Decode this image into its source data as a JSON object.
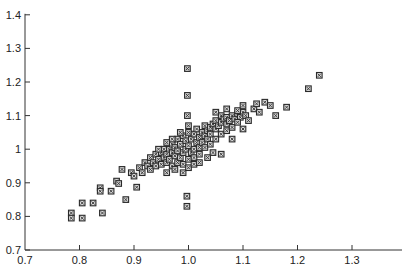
{
  "chart_data": {
    "type": "scatter",
    "title": "",
    "xlabel": "",
    "ylabel": "",
    "xlim": [
      0.7,
      1.385
    ],
    "ylim": [
      0.7,
      1.4
    ],
    "xticks": [
      0.7,
      0.8,
      0.9,
      1.0,
      1.1,
      1.2,
      1.3
    ],
    "xtick_labels": [
      "0.7",
      "0.8",
      "0.9",
      "1.0",
      "1.1",
      "1.2",
      "1.3"
    ],
    "yticks": [
      0.7,
      0.8,
      0.9,
      1.0,
      1.1,
      1.2,
      1.3,
      1.4
    ],
    "ytick_labels": [
      "0.7",
      "0.8",
      "0.9",
      "1",
      "1.1",
      "1.2",
      "1.3",
      "1.4"
    ],
    "grid": false,
    "legend": null,
    "marker": "square-with-dot",
    "marker_color": "#333333",
    "series": [
      {
        "name": "points",
        "points": [
          [
            0.785,
            0.81
          ],
          [
            0.785,
            0.795
          ],
          [
            0.805,
            0.795
          ],
          [
            0.805,
            0.84
          ],
          [
            0.825,
            0.84
          ],
          [
            0.838,
            0.885
          ],
          [
            0.838,
            0.875
          ],
          [
            0.842,
            0.81
          ],
          [
            0.858,
            0.875
          ],
          [
            0.868,
            0.905
          ],
          [
            0.872,
            0.898
          ],
          [
            0.878,
            0.94
          ],
          [
            0.895,
            0.93
          ],
          [
            0.905,
            0.887
          ],
          [
            0.885,
            0.85
          ],
          [
            0.9,
            0.92
          ],
          [
            0.91,
            0.945
          ],
          [
            0.915,
            0.93
          ],
          [
            0.92,
            0.96
          ],
          [
            0.925,
            0.95
          ],
          [
            0.93,
            0.94
          ],
          [
            0.93,
            0.975
          ],
          [
            0.935,
            0.96
          ],
          [
            0.94,
            0.95
          ],
          [
            0.94,
            0.985
          ],
          [
            0.945,
            0.97
          ],
          [
            0.95,
            0.955
          ],
          [
            0.95,
            0.99
          ],
          [
            0.955,
            0.975
          ],
          [
            0.955,
            1.0
          ],
          [
            0.96,
            0.96
          ],
          [
            0.96,
            0.985
          ],
          [
            0.965,
            1.0
          ],
          [
            0.965,
            0.97
          ],
          [
            0.97,
            0.95
          ],
          [
            0.97,
            0.99
          ],
          [
            0.97,
            1.015
          ],
          [
            0.975,
            0.98
          ],
          [
            0.975,
            1.005
          ],
          [
            0.98,
            0.96
          ],
          [
            0.98,
            0.995
          ],
          [
            0.98,
            1.03
          ],
          [
            0.985,
            0.975
          ],
          [
            0.985,
            1.015
          ],
          [
            0.99,
            0.99
          ],
          [
            0.99,
            1.04
          ],
          [
            0.99,
            0.955
          ],
          [
            0.995,
            1.0
          ],
          [
            0.995,
            1.025
          ],
          [
            1.0,
            0.97
          ],
          [
            1.0,
            1.01
          ],
          [
            1.0,
            1.05
          ],
          [
            1.005,
            0.99
          ],
          [
            1.005,
            1.03
          ],
          [
            1.01,
            1.0
          ],
          [
            1.01,
            1.045
          ],
          [
            1.01,
            0.975
          ],
          [
            1.015,
            1.02
          ],
          [
            1.015,
            1.06
          ],
          [
            1.02,
            1.005
          ],
          [
            1.02,
            1.035
          ],
          [
            1.025,
            1.05
          ],
          [
            1.025,
            1.02
          ],
          [
            1.03,
            1.04
          ],
          [
            1.03,
            1.07
          ],
          [
            1.035,
            1.055
          ],
          [
            1.035,
            1.03
          ],
          [
            1.04,
            1.065
          ],
          [
            1.04,
            1.045
          ],
          [
            1.045,
            1.075
          ],
          [
            1.05,
            1.06
          ],
          [
            1.05,
            1.085
          ],
          [
            1.055,
            1.07
          ],
          [
            1.06,
            1.08
          ],
          [
            1.06,
            1.1
          ],
          [
            1.065,
            1.09
          ],
          [
            1.07,
            1.075
          ],
          [
            1.07,
            1.095
          ],
          [
            1.075,
            1.085
          ],
          [
            1.08,
            1.1
          ],
          [
            1.085,
            1.09
          ],
          [
            1.09,
            1.105
          ],
          [
            1.095,
            1.095
          ],
          [
            1.1,
            1.11
          ],
          [
            1.105,
            1.1
          ],
          [
            0.96,
            0.93
          ],
          [
            0.975,
            0.94
          ],
          [
            0.99,
            0.93
          ],
          [
            1.0,
            0.945
          ],
          [
            1.01,
            0.955
          ],
          [
            0.97,
            1.03
          ],
          [
            0.985,
            1.05
          ],
          [
            1.0,
            1.07
          ],
          [
            0.96,
            1.02
          ],
          [
            0.945,
            1.0
          ],
          [
            1.02,
            0.985
          ],
          [
            1.03,
            1.005
          ],
          [
            1.04,
            1.015
          ],
          [
            1.05,
            1.03
          ],
          [
            1.06,
            1.045
          ],
          [
            1.07,
            1.055
          ],
          [
            1.08,
            1.065
          ],
          [
            1.035,
            0.975
          ],
          [
            1.02,
            0.96
          ],
          [
            1.045,
            0.99
          ],
          [
            0.998,
            1.24
          ],
          [
            0.998,
            1.16
          ],
          [
            0.998,
            1.1
          ],
          [
            0.997,
            0.86
          ],
          [
            0.997,
            0.83
          ],
          [
            1.05,
            1.11
          ],
          [
            1.07,
            1.12
          ],
          [
            1.09,
            1.115
          ],
          [
            1.1,
            1.13
          ],
          [
            1.12,
            1.12
          ],
          [
            1.125,
            1.135
          ],
          [
            1.13,
            1.11
          ],
          [
            1.14,
            1.14
          ],
          [
            1.15,
            1.13
          ],
          [
            1.16,
            1.1
          ],
          [
            1.18,
            1.125
          ],
          [
            1.22,
            1.18
          ],
          [
            1.24,
            1.22
          ],
          [
            1.11,
            1.085
          ],
          [
            1.09,
            1.08
          ],
          [
            1.06,
            0.985
          ],
          [
            1.08,
            1.03
          ],
          [
            1.1,
            1.06
          ]
        ]
      }
    ]
  }
}
